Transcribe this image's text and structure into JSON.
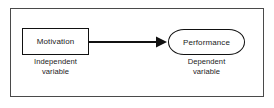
{
  "diagram": {
    "frame": {
      "border_color": "#4a4a4a"
    },
    "nodes": [
      {
        "id": "independent",
        "shape": "rectangle",
        "label": "Motivation",
        "caption_line1": "Independent",
        "caption_line2": "variable",
        "border_color": "#111111",
        "fill_color": "#ffffff"
      },
      {
        "id": "dependent",
        "shape": "rounded-rectangle",
        "label": "Performance",
        "caption_line1": "Dependent",
        "caption_line2": "variable",
        "border_color": "#111111",
        "fill_color": "#ffffff"
      }
    ],
    "connector": {
      "id": "motivation-to-performance",
      "type": "arrow",
      "direction": "left-to-right",
      "from": "independent",
      "to": "dependent",
      "color": "#111111",
      "label": ""
    }
  }
}
